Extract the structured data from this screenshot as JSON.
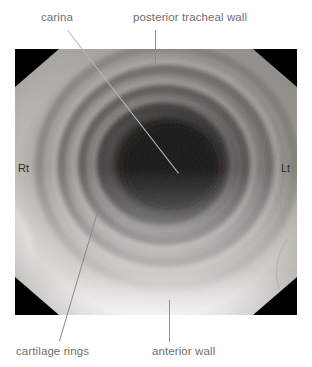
{
  "figure": {
    "kind": "annotated-bronchoscopic-photograph"
  },
  "annotations": [
    {
      "id": "carina",
      "label": "carina",
      "leader": "diagonal"
    },
    {
      "id": "posterior",
      "label": "posterior tracheal wall",
      "leader": "vertical"
    },
    {
      "id": "cartilage",
      "label": "cartilage rings",
      "leader": "diagonal"
    },
    {
      "id": "anterior",
      "label": "anterior wall",
      "leader": "vertical"
    }
  ],
  "orientation": {
    "right": "Rt",
    "left": "Lt"
  },
  "colors": {
    "background": "#ffffff",
    "label_text": "#6e6e6e",
    "leader_line": "#8e8e8e",
    "orientation_text": "#2c2c2c",
    "photo_corner": "#000000",
    "photo_bright": "#d8d6d2",
    "photo_mid": "#8f8d89",
    "photo_lumen": "#191817"
  }
}
